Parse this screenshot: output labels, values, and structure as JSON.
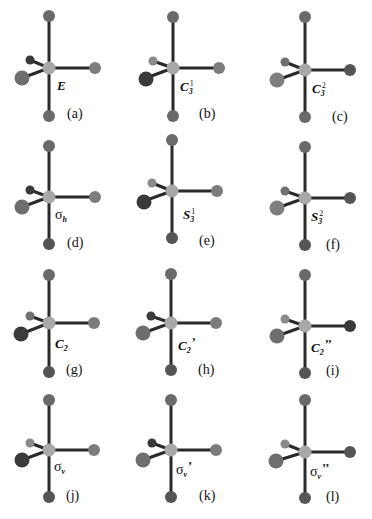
{
  "figure": {
    "colors": {
      "bond": "#2a2a2a",
      "center_atom": "#a8a8a8",
      "axial_atom": "#6a6a6a",
      "equatorial_atom": "#7c7c7c",
      "highlighted_atom": "#3a3a3a",
      "background": "#ffffff"
    },
    "panels": [
      {
        "id": "a",
        "label": "(a)",
        "op_main": "E",
        "op_sub": "",
        "op_sup": "",
        "op_prime": "",
        "kind": "identity"
      },
      {
        "id": "b",
        "label": "(b)",
        "op_main": "C",
        "op_sub": "3",
        "op_sup": "1",
        "op_prime": "",
        "kind": "rotation"
      },
      {
        "id": "c",
        "label": "(c)",
        "op_main": "C",
        "op_sub": "3",
        "op_sup": "2",
        "op_prime": "",
        "kind": "rotation"
      },
      {
        "id": "d",
        "label": "(d)",
        "op_main": "σ",
        "op_sub": "h",
        "op_sup": "",
        "op_prime": "",
        "kind": "reflection"
      },
      {
        "id": "e",
        "label": "(e)",
        "op_main": "S",
        "op_sub": "3",
        "op_sup": "1",
        "op_prime": "",
        "kind": "improper"
      },
      {
        "id": "f",
        "label": "(f)",
        "op_main": "S",
        "op_sub": "3",
        "op_sup": "2",
        "op_prime": "",
        "kind": "improper"
      },
      {
        "id": "g",
        "label": "(g)",
        "op_main": "C",
        "op_sub": "2",
        "op_sup": "",
        "op_prime": "",
        "kind": "rotation"
      },
      {
        "id": "h",
        "label": "(h)",
        "op_main": "C",
        "op_sub": "2",
        "op_sup": "",
        "op_prime": "’",
        "kind": "rotation"
      },
      {
        "id": "i",
        "label": "(i)",
        "op_main": "C",
        "op_sub": "2",
        "op_sup": "",
        "op_prime": "’’",
        "kind": "rotation"
      },
      {
        "id": "j",
        "label": "(j)",
        "op_main": "σ",
        "op_sub": "v",
        "op_sup": "",
        "op_prime": "",
        "kind": "reflection"
      },
      {
        "id": "k",
        "label": "(k)",
        "op_main": "σ",
        "op_sub": "v",
        "op_sup": "",
        "op_prime": "’",
        "kind": "reflection"
      },
      {
        "id": "l",
        "label": "(l)",
        "op_main": "σ",
        "op_sub": "v",
        "op_sup": "",
        "op_prime": "’’",
        "kind": "reflection"
      }
    ]
  }
}
